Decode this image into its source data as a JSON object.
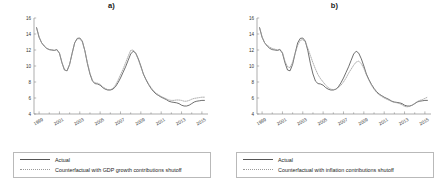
{
  "figure": {
    "panels": [
      {
        "title": "a)",
        "legend": [
          {
            "label": "Actual",
            "style": "solid"
          },
          {
            "label": "Counterfactual with GDP growth contributions shutoff",
            "style": "dotted"
          }
        ]
      },
      {
        "title": "b)",
        "legend": [
          {
            "label": "Actual",
            "style": "solid"
          },
          {
            "label": "Counterfactual with inflation contributions shutoff",
            "style": "dotted"
          }
        ]
      }
    ]
  },
  "chart_data": [
    {
      "type": "line",
      "title": "a)",
      "xlabel": "",
      "ylabel": "",
      "xlim": [
        1998.5,
        2015.6
      ],
      "ylim": [
        4,
        16
      ],
      "yticks": [
        4,
        6,
        8,
        10,
        12,
        14,
        16
      ],
      "xticks": [
        1999,
        2001,
        2003,
        2005,
        2007,
        2009,
        2011,
        2013,
        2015
      ],
      "grid": false,
      "legend_position": "below",
      "x": [
        1998.75,
        1999.0,
        1999.25,
        1999.5,
        1999.75,
        2000.0,
        2000.25,
        2000.5,
        2000.75,
        2001.0,
        2001.25,
        2001.5,
        2001.75,
        2002.0,
        2002.25,
        2002.5,
        2002.75,
        2003.0,
        2003.25,
        2003.5,
        2003.75,
        2004.0,
        2004.25,
        2004.5,
        2004.75,
        2005.0,
        2005.25,
        2005.5,
        2005.75,
        2006.0,
        2006.25,
        2006.5,
        2006.75,
        2007.0,
        2007.25,
        2007.5,
        2007.75,
        2008.0,
        2008.25,
        2008.5,
        2008.75,
        2009.0,
        2009.25,
        2009.5,
        2009.75,
        2010.0,
        2010.25,
        2010.5,
        2010.75,
        2011.0,
        2011.25,
        2011.5,
        2011.75,
        2012.0,
        2012.25,
        2012.5,
        2012.75,
        2013.0,
        2013.25,
        2013.5,
        2013.75,
        2014.0,
        2014.25,
        2014.5,
        2014.75,
        2015.0,
        2015.25
      ],
      "series": [
        {
          "name": "Actual",
          "style": "solid",
          "values": [
            14.8,
            13.6,
            12.9,
            12.5,
            12.2,
            12.05,
            12.0,
            11.95,
            12.05,
            11.6,
            10.4,
            9.5,
            9.4,
            10.2,
            11.6,
            12.9,
            13.45,
            13.5,
            13.1,
            11.9,
            10.3,
            9.0,
            8.1,
            7.8,
            7.75,
            7.6,
            7.3,
            7.1,
            7.0,
            7.0,
            7.1,
            7.4,
            7.9,
            8.5,
            9.2,
            9.9,
            10.7,
            11.5,
            11.85,
            11.6,
            10.9,
            10.0,
            9.0,
            8.3,
            7.7,
            7.2,
            6.8,
            6.5,
            6.3,
            6.1,
            5.95,
            5.8,
            5.6,
            5.5,
            5.45,
            5.4,
            5.3,
            5.1,
            5.0,
            5.0,
            5.1,
            5.3,
            5.5,
            5.6,
            5.65,
            5.7,
            5.7
          ]
        },
        {
          "name": "Counterfactual with GDP growth contributions shutoff",
          "style": "dotted",
          "values": [
            14.8,
            13.6,
            12.9,
            12.5,
            12.2,
            12.05,
            12.0,
            11.95,
            12.05,
            11.6,
            10.4,
            9.5,
            9.4,
            10.2,
            11.6,
            12.9,
            13.4,
            13.4,
            13.0,
            11.9,
            10.4,
            9.1,
            8.2,
            7.9,
            7.85,
            7.7,
            7.4,
            7.2,
            7.05,
            7.05,
            7.2,
            7.6,
            8.2,
            8.9,
            9.6,
            10.4,
            11.2,
            11.95,
            12.0,
            11.6,
            10.8,
            9.9,
            9.0,
            8.35,
            7.8,
            7.3,
            6.9,
            6.6,
            6.4,
            6.2,
            6.05,
            5.9,
            5.75,
            5.7,
            5.7,
            5.75,
            5.75,
            5.7,
            5.6,
            5.6,
            5.7,
            5.85,
            5.95,
            6.0,
            6.05,
            6.1,
            6.1
          ]
        }
      ]
    },
    {
      "type": "line",
      "title": "b)",
      "xlabel": "",
      "ylabel": "",
      "xlim": [
        1998.5,
        2015.6
      ],
      "ylim": [
        4,
        16
      ],
      "yticks": [
        4,
        6,
        8,
        10,
        12,
        14,
        16
      ],
      "xticks": [
        1999,
        2001,
        2003,
        2005,
        2007,
        2009,
        2011,
        2013,
        2015
      ],
      "grid": false,
      "legend_position": "below",
      "x": [
        1998.75,
        1999.0,
        1999.25,
        1999.5,
        1999.75,
        2000.0,
        2000.25,
        2000.5,
        2000.75,
        2001.0,
        2001.25,
        2001.5,
        2001.75,
        2002.0,
        2002.25,
        2002.5,
        2002.75,
        2003.0,
        2003.25,
        2003.5,
        2003.75,
        2004.0,
        2004.25,
        2004.5,
        2004.75,
        2005.0,
        2005.25,
        2005.5,
        2005.75,
        2006.0,
        2006.25,
        2006.5,
        2006.75,
        2007.0,
        2007.25,
        2007.5,
        2007.75,
        2008.0,
        2008.25,
        2008.5,
        2008.75,
        2009.0,
        2009.25,
        2009.5,
        2009.75,
        2010.0,
        2010.25,
        2010.5,
        2010.75,
        2011.0,
        2011.25,
        2011.5,
        2011.75,
        2012.0,
        2012.25,
        2012.5,
        2012.75,
        2013.0,
        2013.25,
        2013.5,
        2013.75,
        2014.0,
        2014.25,
        2014.5,
        2014.75,
        2015.0,
        2015.25
      ],
      "series": [
        {
          "name": "Actual",
          "style": "solid",
          "values": [
            14.8,
            13.6,
            12.9,
            12.5,
            12.2,
            12.05,
            12.0,
            11.95,
            12.05,
            11.6,
            10.4,
            9.5,
            9.4,
            10.2,
            11.6,
            12.9,
            13.45,
            13.5,
            13.1,
            11.9,
            10.3,
            9.0,
            8.1,
            7.8,
            7.75,
            7.6,
            7.3,
            7.1,
            7.0,
            7.0,
            7.1,
            7.4,
            7.9,
            8.5,
            9.2,
            9.9,
            10.7,
            11.5,
            11.85,
            11.6,
            10.9,
            10.0,
            9.0,
            8.3,
            7.7,
            7.2,
            6.8,
            6.5,
            6.3,
            6.1,
            5.95,
            5.8,
            5.6,
            5.5,
            5.45,
            5.4,
            5.3,
            5.1,
            5.0,
            5.0,
            5.1,
            5.3,
            5.5,
            5.6,
            5.65,
            5.7,
            5.7
          ]
        },
        {
          "name": "Counterfactual with inflation contributions shutoff",
          "style": "dotted",
          "values": [
            14.8,
            13.6,
            12.9,
            12.6,
            12.35,
            12.2,
            12.1,
            12.0,
            12.1,
            11.7,
            10.6,
            9.9,
            9.8,
            10.5,
            11.6,
            12.6,
            13.2,
            13.3,
            13.0,
            12.2,
            11.3,
            10.4,
            9.6,
            8.9,
            8.4,
            8.0,
            7.6,
            7.3,
            7.1,
            7.05,
            7.1,
            7.3,
            7.6,
            8.0,
            8.5,
            9.1,
            9.6,
            10.1,
            10.5,
            10.6,
            10.3,
            9.7,
            8.9,
            8.2,
            7.6,
            7.1,
            6.7,
            6.4,
            6.2,
            6.0,
            5.85,
            5.7,
            5.55,
            5.45,
            5.4,
            5.3,
            5.15,
            4.95,
            4.9,
            4.95,
            5.1,
            5.3,
            5.55,
            5.7,
            5.8,
            5.95,
            6.1
          ]
        }
      ]
    }
  ]
}
